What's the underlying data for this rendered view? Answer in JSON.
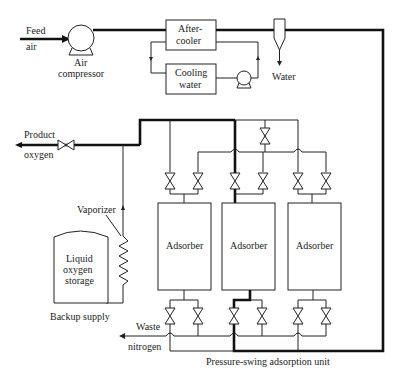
{
  "diagram": {
    "labels": {
      "feed_air_1": "Feed",
      "feed_air_2": "air",
      "air_compressor_1": "Air",
      "air_compressor_2": "compressor",
      "aftercooler_1": "After-",
      "aftercooler_2": "cooler",
      "cooling_water_1": "Cooling",
      "cooling_water_2": "water",
      "water": "Water",
      "product_oxygen_1": "Product",
      "product_oxygen_2": "oxygen",
      "vaporizer": "Vaporizer",
      "liquid_oxygen_1": "Liquid",
      "liquid_oxygen_2": "oxygen",
      "liquid_oxygen_3": "storage",
      "backup_supply": "Backup supply",
      "adsorber_1": "Adsorber",
      "adsorber_2": "Adsorber",
      "adsorber_3": "Adsorber",
      "waste_nitrogen_1": "Waste",
      "waste_nitrogen_2": "nitrogen",
      "psa_unit": "Pressure-swing adsorption unit"
    }
  }
}
